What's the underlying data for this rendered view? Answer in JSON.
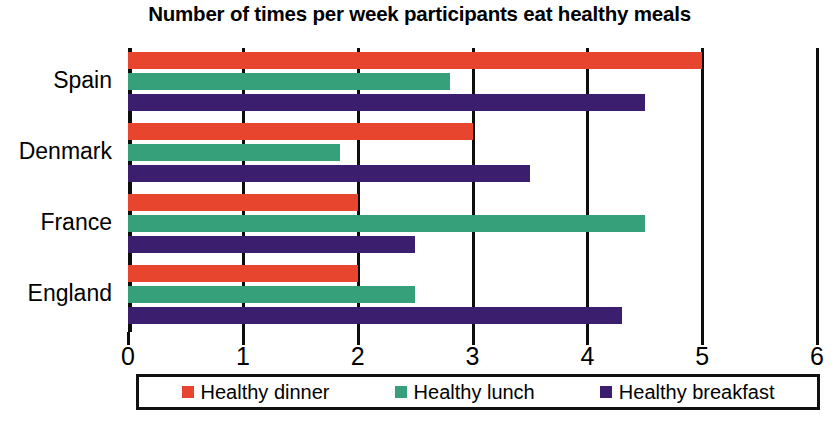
{
  "chart_data": {
    "type": "bar",
    "orientation": "horizontal",
    "title": "Number of times per week participants eat healthy meals",
    "xlabel": "",
    "ylabel": "",
    "xlim": [
      0,
      6
    ],
    "xticks": [
      0,
      1,
      2,
      3,
      4,
      5,
      6
    ],
    "xtick_labels": [
      "0",
      "1",
      "2",
      "3",
      "4",
      "5",
      "6"
    ],
    "grid": "vertical",
    "legend_position": "bottom",
    "categories": [
      "Spain",
      "Denmark",
      "France",
      "England"
    ],
    "series": [
      {
        "name": "Healthy dinner",
        "color": "#e8452f",
        "values": [
          5,
          3,
          2,
          2
        ]
      },
      {
        "name": "Healthy lunch",
        "color": "#36a07a",
        "values": [
          2.8,
          1.85,
          4.5,
          2.5
        ]
      },
      {
        "name": "Healthy breakfast",
        "color": "#3b1e6e",
        "values": [
          4.5,
          3.5,
          2.5,
          4.3
        ]
      }
    ]
  },
  "legend": {
    "items": [
      {
        "label": "Healthy dinner",
        "swatch": "dinner-swatch"
      },
      {
        "label": "Healthy lunch",
        "swatch": "lunch-swatch"
      },
      {
        "label": "Healthy breakfast",
        "swatch": "breakfast-swatch"
      }
    ]
  }
}
